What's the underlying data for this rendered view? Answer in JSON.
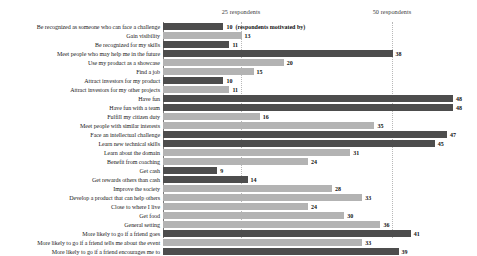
{
  "chart_data": {
    "type": "bar",
    "orientation": "horizontal",
    "title": "",
    "xlabel": "(respondents motivated by)",
    "ylabel": "",
    "xlim": [
      0,
      50
    ],
    "grid": true,
    "gridlines": [
      25,
      50
    ],
    "legend": "none",
    "tick_labels": [
      "25 respondents",
      "50 respondents"
    ],
    "axis_title_inline": "(respondents motivated by)",
    "categories": [
      "Be recognized as someone who can face a challenge",
      "Gain visibility",
      "Be recognized for my skills",
      "Meet people who may help me in the future",
      "Use my product as a showcase",
      "Find a job",
      "Attract investors for my product",
      "Attract investors for my other projects",
      "Have fun",
      "Have fun with a team",
      "Fulfill my citizen duty",
      "Meet people with similar interests",
      "Face an intellectual challenge",
      "Learn new technical skills",
      "Learn about the domain",
      "Benefit from coaching",
      "Get cash",
      "Get rewards others than cash",
      "Improve the society",
      "Develop a product that can help others",
      "Close to where I live",
      "Get food",
      "General setting",
      "More likely to go if a friend goes",
      "More likely to go if a friend tells me about the event",
      "More likely to go if a friend encourages me to"
    ],
    "values": [
      10,
      13,
      11,
      38,
      20,
      15,
      10,
      11,
      48,
      48,
      16,
      35,
      47,
      45,
      31,
      24,
      9,
      14,
      28,
      33,
      24,
      30,
      36,
      41,
      33,
      39
    ],
    "bar_shades": [
      "dark",
      "light",
      "dark",
      "dark",
      "light",
      "light",
      "dark",
      "light",
      "dark",
      "dark",
      "light",
      "light",
      "dark",
      "dark",
      "light",
      "light",
      "dark",
      "dark",
      "light",
      "light",
      "light",
      "light",
      "light",
      "dark",
      "light",
      "dark"
    ],
    "colors": {
      "dark": "#4d4d4d",
      "light": "#b3b3b3",
      "gridline": "#b8b8b8",
      "axis": "#7a7a7a"
    }
  }
}
